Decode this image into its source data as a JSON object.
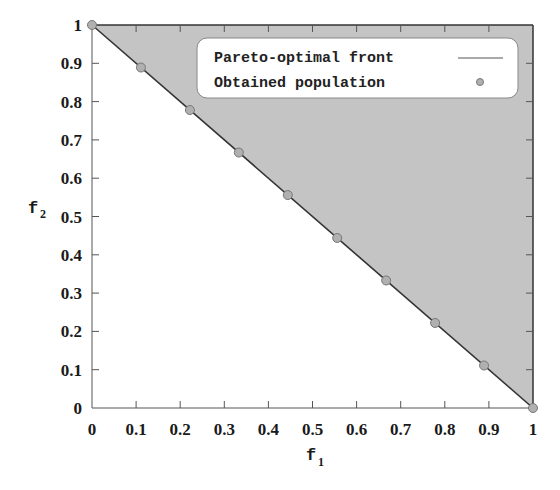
{
  "chart_data": {
    "type": "scatter",
    "title": "",
    "xlabel": "f1",
    "ylabel": "f2",
    "xlabel_main": "f",
    "xlabel_sub": "1",
    "ylabel_main": "f",
    "ylabel_sub": "2",
    "xlim": [
      0,
      1
    ],
    "ylim": [
      0,
      1
    ],
    "grid": false,
    "legend_position": "upper right",
    "x_ticks": [
      "0",
      "0.1",
      "0.2",
      "0.3",
      "0.4",
      "0.5",
      "0.6",
      "0.7",
      "0.8",
      "0.9",
      "1"
    ],
    "y_ticks": [
      "0",
      "0.1",
      "0.2",
      "0.3",
      "0.4",
      "0.5",
      "0.6",
      "0.7",
      "0.8",
      "0.9",
      "1"
    ],
    "series": [
      {
        "name": "Pareto-optimal front",
        "kind": "line",
        "x": [
          0,
          1
        ],
        "y": [
          1,
          0
        ]
      },
      {
        "name": "Obtained population",
        "kind": "scatter",
        "x": [
          0,
          0.111,
          0.222,
          0.333,
          0.444,
          0.556,
          0.667,
          0.778,
          0.889,
          1
        ],
        "y": [
          1,
          0.889,
          0.778,
          0.667,
          0.556,
          0.444,
          0.333,
          0.222,
          0.111,
          0
        ]
      }
    ],
    "shaded_region": "dominated region above the front (f1 + f2 >= 1), gray fill"
  },
  "legend": {
    "items": [
      {
        "label": "Pareto-optimal front",
        "marker": "line"
      },
      {
        "label": "Obtained population",
        "marker": "circle"
      }
    ]
  },
  "colors": {
    "fill": "#c4c4c4",
    "line": "#333333",
    "marker": "#b0b0b0",
    "marker_edge": "#777777",
    "axis": "#555555"
  }
}
